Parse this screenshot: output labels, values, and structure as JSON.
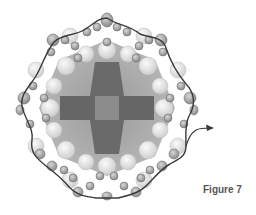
{
  "figure": {
    "caption": "Figure 7",
    "colors": {
      "background": "#ffffff",
      "outer_sphere": "#9a9a9a",
      "outer_sphere_stroke": "#6e6e6e",
      "inner_sphere": "#e2e2e2",
      "cross_dark": "#5e5e5e",
      "cross_mid": "#7a7a7a",
      "center_square": "#8c8c8c",
      "field": "#a8a8a8",
      "trace_line": "#3a3a3a",
      "caption": "#555555"
    },
    "geometry": {
      "center": [
        107,
        108
      ],
      "ring_radius": 80,
      "ring_sides": 8,
      "arrow_end": [
        212,
        128
      ]
    }
  }
}
